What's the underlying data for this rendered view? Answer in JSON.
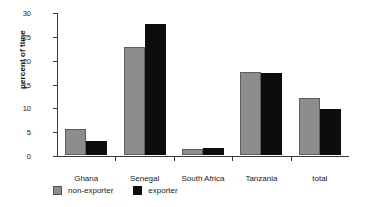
{
  "chart_data": {
    "type": "bar",
    "title": "",
    "xlabel": "",
    "ylabel": "percent of time",
    "ylim": [
      0,
      30
    ],
    "yticks": [
      0,
      5,
      10,
      15,
      20,
      25,
      30
    ],
    "ytick_labels": [
      "0",
      "5",
      "10",
      "15",
      "20",
      "25",
      "30"
    ],
    "grid": false,
    "legend_position": "bottom-left",
    "categories": [
      "Ghana",
      "Senegal",
      "South Africa",
      "Tanzania",
      "total"
    ],
    "series": [
      {
        "name": "non-exporter",
        "color": "#8d8d8d",
        "values": [
          5.5,
          22.7,
          1.3,
          17.5,
          12.0
        ]
      },
      {
        "name": "exporter",
        "color": "#0d0d0d",
        "values": [
          3.0,
          27.5,
          1.5,
          17.2,
          9.6
        ]
      }
    ]
  },
  "axis": {
    "y_title": "percent of time"
  },
  "legend": {
    "items": [
      {
        "label": "non-exporter",
        "swatch": "gray-square-icon"
      },
      {
        "label": "exporter",
        "swatch": "black-square-icon"
      }
    ]
  }
}
